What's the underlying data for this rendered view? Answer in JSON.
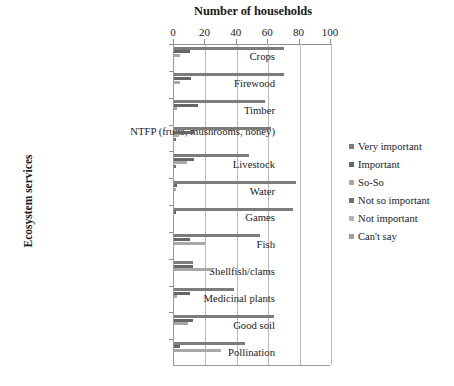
{
  "chart_data": {
    "type": "bar",
    "orientation": "horizontal",
    "title": "Number of households",
    "xlabel": "Number of households",
    "ylabel": "Ecosystem services",
    "xlim": [
      0,
      100
    ],
    "xticks": [
      0,
      20,
      40,
      60,
      80,
      100
    ],
    "xtick_labels": [
      "0",
      "20",
      "40",
      "60",
      "80",
      "100"
    ],
    "grid": true,
    "legend_position": "right",
    "categories": [
      "Crops",
      "Firewood",
      "Timber",
      "NTFP (fruits, mushrooms, honey)",
      "Livestock",
      "Water",
      "Games",
      "Fish",
      "Shellfish/clams",
      "Medicinal plants",
      "Good soil",
      "Pollination"
    ],
    "series": [
      {
        "name": "Very important",
        "color": "#7c7c7c",
        "values": [
          70,
          70,
          58,
          62,
          48,
          78,
          76,
          55,
          12,
          38,
          64,
          45
        ]
      },
      {
        "name": "Important",
        "color": "#666666",
        "values": [
          10,
          11,
          15,
          13,
          13,
          2,
          1,
          10,
          12,
          10,
          12,
          4
        ]
      },
      {
        "name": "So-So",
        "color": "#a8a8a8",
        "values": [
          4,
          4,
          2,
          3,
          8,
          1,
          0,
          20,
          25,
          2,
          9,
          30
        ]
      },
      {
        "name": "Not so important",
        "color": "#6f6f6f",
        "values": [
          0,
          0,
          0,
          1,
          1,
          0,
          0,
          0,
          0,
          0,
          0,
          0
        ]
      },
      {
        "name": "Not important",
        "color": "#b5b5b5",
        "values": [
          0,
          0,
          0,
          0,
          0,
          0,
          0,
          0,
          0,
          0,
          0,
          0
        ]
      },
      {
        "name": "Can't say",
        "color": "#9d9d9d",
        "values": [
          0,
          0,
          0,
          0,
          0,
          0,
          0,
          0,
          0,
          0,
          0,
          0
        ]
      }
    ]
  },
  "legend": {
    "items": [
      {
        "label": "Very important",
        "color": "#7c7c7c"
      },
      {
        "label": "Important",
        "color": "#666666"
      },
      {
        "label": "So-So",
        "color": "#a8a8a8"
      },
      {
        "label": "Not so important",
        "color": "#6f6f6f"
      },
      {
        "label": "Not important",
        "color": "#b5b5b5"
      },
      {
        "label": "Can't say",
        "color": "#9d9d9d"
      }
    ]
  },
  "axes": {
    "title_top": "Number of households",
    "title_left": "Ecosystem services"
  }
}
